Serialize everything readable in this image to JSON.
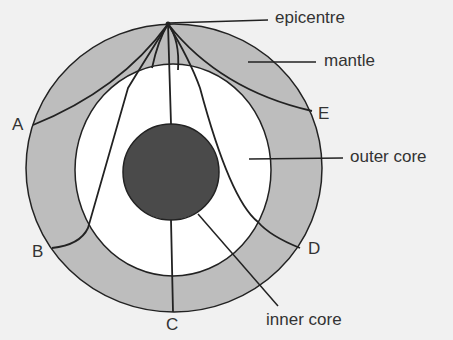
{
  "diagram": {
    "colors": {
      "background": "#f1f1f1",
      "mantle": "#bdbdbd",
      "outer_core": "#ffffff",
      "inner_core": "#4a4a4a",
      "stroke": "#222222",
      "text": "#333333"
    },
    "labels": {
      "epicentre": "epicentre",
      "mantle": "mantle",
      "outer_core": "outer core",
      "inner_core": "inner core"
    },
    "stations": [
      "A",
      "B",
      "C",
      "D",
      "E"
    ]
  }
}
